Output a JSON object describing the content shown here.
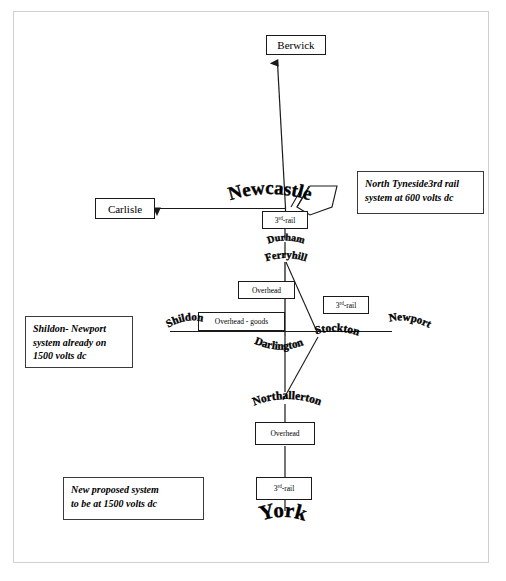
{
  "diagram": {
    "stations": [
      {
        "id": "berwick",
        "label": "Berwick",
        "style": "box"
      },
      {
        "id": "carlisle",
        "label": "Carlisle",
        "style": "box"
      },
      {
        "id": "newcastle",
        "label": "Newcastle",
        "style": "arc"
      },
      {
        "id": "durham",
        "label": "Durham",
        "style": "arc"
      },
      {
        "id": "ferryhill",
        "label": "Ferryhill",
        "style": "arc"
      },
      {
        "id": "shildon",
        "label": "Shildon",
        "style": "arc"
      },
      {
        "id": "darlington",
        "label": "Darlington",
        "style": "arc"
      },
      {
        "id": "stockton",
        "label": "Stockton",
        "style": "arc"
      },
      {
        "id": "newport",
        "label": "Newport",
        "style": "arc"
      },
      {
        "id": "northallerton",
        "label": "Northallerton",
        "style": "arc"
      },
      {
        "id": "york",
        "label": "York",
        "style": "arc"
      }
    ],
    "tech_boxes": [
      {
        "id": "tyneside-third-rail",
        "label_pre": "3",
        "label_sup": "rd",
        "label_post": "-rail"
      },
      {
        "id": "ferryhill-overhead",
        "label": "Overhead"
      },
      {
        "id": "shildon-overhead-goods",
        "label": "Overhead - goods"
      },
      {
        "id": "stockton-third-rail",
        "label_pre": "3",
        "label_sup": "rd",
        "label_post": "-rail"
      },
      {
        "id": "northallerton-overhead",
        "label": "Overhead"
      },
      {
        "id": "york-third-rail",
        "label_pre": "3",
        "label_sup": "rd",
        "label_post": "-rail"
      }
    ],
    "legends": [
      {
        "id": "north-tyneside",
        "line1": "North Tyneside3rd rail",
        "line2": "system at 600 volts dc"
      },
      {
        "id": "shildon-newport",
        "line1": "Shildon- Newport",
        "line2": "system already on",
        "line3": "1500 volts dc"
      },
      {
        "id": "new-proposed",
        "line1": "New proposed system",
        "line2": "to be at 1500 volts dc"
      }
    ],
    "colors": {
      "line": "#1a1a1a",
      "frame": "#d0d0d0",
      "text": "#000000",
      "background": "#ffffff"
    }
  }
}
